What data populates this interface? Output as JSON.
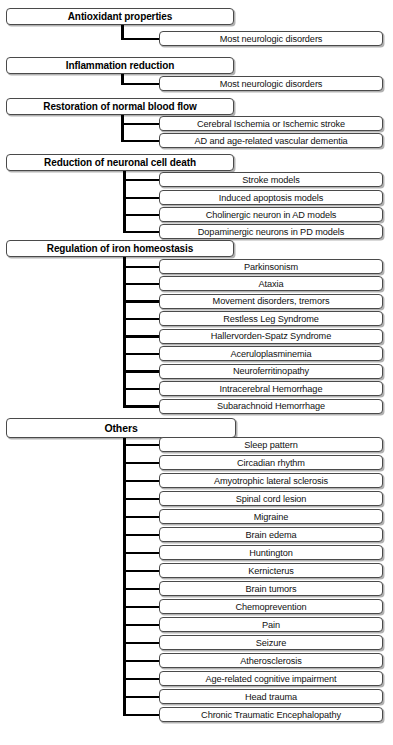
{
  "diagram": {
    "type": "hierarchical-tree",
    "colors": {
      "box_border": "#4a4a4a",
      "box_fill": "#ffffff",
      "connector": "#000000",
      "text": "#000000"
    },
    "sections": [
      {
        "header": "Antioxidant properties",
        "header_width": 228,
        "header_top": 8,
        "header_tall": false,
        "trunk_x": 121,
        "branch_from": 159,
        "children": [
          {
            "label": "Most neurologic disorders",
            "top": 31
          }
        ]
      },
      {
        "header": "Inflammation reduction",
        "header_width": 228,
        "header_top": 57,
        "header_tall": false,
        "trunk_x": 121,
        "branch_from": 159,
        "children": [
          {
            "label": "Most neurologic disorders",
            "top": 76
          }
        ]
      },
      {
        "header": "Restoration of normal blood flow",
        "header_width": 228,
        "header_top": 98,
        "header_tall": false,
        "trunk_x": 121,
        "branch_from": 159,
        "children": [
          {
            "label": "Cerebral Ischemia or Ischemic stroke",
            "top": 116
          },
          {
            "label": "AD and age-related vascular dementia",
            "top": 133
          }
        ]
      },
      {
        "header": "Reduction of neuronal cell death",
        "header_width": 228,
        "header_top": 154,
        "header_tall": false,
        "trunk_x": 123,
        "branch_from": 159,
        "children": [
          {
            "label": "Stroke models",
            "top": 172
          },
          {
            "label": "Induced apoptosis models",
            "top": 190
          },
          {
            "label": "Cholinergic neuron in AD models",
            "top": 207
          },
          {
            "label": "Dopaminergic neurons in PD models",
            "top": 224
          }
        ]
      },
      {
        "header": "Regulation of iron homeostasis",
        "header_width": 228,
        "header_top": 240,
        "header_tall": false,
        "trunk_x": 123,
        "branch_from": 159,
        "children": [
          {
            "label": "Parkinsonism",
            "top": 259
          },
          {
            "label": "Ataxia",
            "top": 276
          },
          {
            "label": "Movement disorders, tremors",
            "top": 293.5
          },
          {
            "label": "Restless Leg Syndrome",
            "top": 311
          },
          {
            "label": "Hallervorden-Spatz Syndrome",
            "top": 328.5
          },
          {
            "label": "Aceruloplasminemia",
            "top": 346
          },
          {
            "label": "Neuroferritinopathy",
            "top": 363.5
          },
          {
            "label": "Intracerebral Hemorrhage",
            "top": 381
          },
          {
            "label": "Subarachnoid Hemorrhage",
            "top": 398.5
          }
        ]
      },
      {
        "header": "Others",
        "header_width": 230,
        "header_top": 418,
        "header_tall": true,
        "trunk_x": 123,
        "branch_from": 159,
        "children": [
          {
            "label": "Sleep pattern",
            "top": 437
          },
          {
            "label": "Circadian rhythm",
            "top": 455
          },
          {
            "label": "Amyotrophic lateral sclerosis",
            "top": 473
          },
          {
            "label": "Spinal cord lesion",
            "top": 491
          },
          {
            "label": "Migraine",
            "top": 509
          },
          {
            "label": "Brain edema",
            "top": 527
          },
          {
            "label": "Huntington",
            "top": 545
          },
          {
            "label": "Kernicterus",
            "top": 563
          },
          {
            "label": "Brain tumors",
            "top": 581
          },
          {
            "label": "Chemoprevention",
            "top": 599
          },
          {
            "label": "Pain",
            "top": 617
          },
          {
            "label": "Seizure",
            "top": 635
          },
          {
            "label": "Atherosclerosis",
            "top": 653
          },
          {
            "label": "Age-related cognitive impairment",
            "top": 671
          },
          {
            "label": "Head trauma",
            "top": 689
          },
          {
            "label": "Chronic Traumatic Encephalopathy",
            "top": 707
          }
        ]
      }
    ]
  }
}
